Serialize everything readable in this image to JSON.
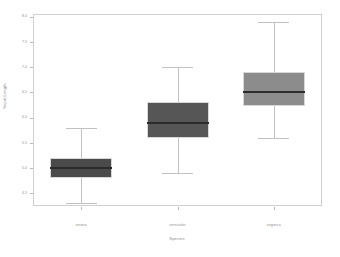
{
  "chart_data": {
    "type": "box",
    "title": "",
    "xlabel": "Species",
    "ylabel": "Sepal.Length",
    "categories": [
      "setosa",
      "versicolor",
      "virginica"
    ],
    "ylim": [
      4.25,
      8.05
    ],
    "yticks": [
      "4.5",
      "5.0",
      "5.5",
      "6.0",
      "6.5",
      "7.0",
      "7.5",
      "8.0"
    ],
    "ytick_values": [
      4.5,
      5.0,
      5.5,
      6.0,
      6.5,
      7.0,
      7.5,
      8.0
    ],
    "grid": false,
    "legend": "none",
    "boxes": [
      {
        "label": "setosa",
        "whisker_low": 4.3,
        "q1": 4.8,
        "median": 5.0,
        "q3": 5.2,
        "whisker_high": 5.8,
        "color": "#4a4a4a"
      },
      {
        "label": "versicolor",
        "whisker_low": 4.9,
        "q1": 5.6,
        "median": 5.9,
        "q3": 6.3,
        "whisker_high": 7.0,
        "color": "#565656"
      },
      {
        "label": "virginica",
        "whisker_low": 5.6,
        "q1": 6.225,
        "median": 6.5,
        "q3": 6.9,
        "whisker_high": 7.9,
        "color": "#8c8c8c"
      }
    ]
  },
  "style": {
    "frame_color": "#cfcfcf",
    "tick_color": "#b9b9b9",
    "text_color": "#8a8a8a",
    "median_color": "#2b2b2b",
    "whisker_color": "#c2c2c2",
    "box_border_color": "#d8d8d8",
    "background": "#ffffff"
  }
}
